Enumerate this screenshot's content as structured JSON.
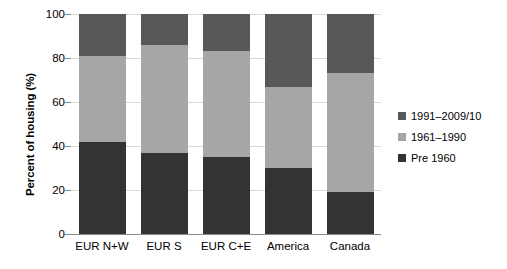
{
  "chart_data": {
    "type": "bar",
    "subtype": "stacked-bar",
    "title": "",
    "xlabel": "",
    "ylabel": "Percent of housing (%)",
    "ylim": [
      0,
      100
    ],
    "yticks": [
      0,
      20,
      40,
      60,
      80,
      100
    ],
    "ytick_labels": [
      "0",
      "20",
      "40",
      "60",
      "80",
      "100"
    ],
    "grid": true,
    "legend_position": "right",
    "categories": [
      "EUR N+W",
      "EUR S",
      "EUR C+E",
      "America",
      "Canada"
    ],
    "series": [
      {
        "name": "Pre 1960",
        "color": "#333333",
        "values": [
          42,
          37,
          35,
          30,
          19
        ]
      },
      {
        "name": "1961–1990",
        "color": "#a6a6a6",
        "values": [
          39,
          49,
          48,
          37,
          54
        ]
      },
      {
        "name": "1991–2009/10",
        "color": "#585858",
        "values": [
          19,
          14,
          17,
          33,
          27
        ]
      }
    ],
    "legend_entries": [
      {
        "label": "1991–2009/10",
        "color": "#585858"
      },
      {
        "label": "1961–1990",
        "color": "#a6a6a6"
      },
      {
        "label": "Pre 1960",
        "color": "#333333"
      }
    ]
  },
  "colors": {
    "gridline": "#d9d9d9",
    "axis": "#898989",
    "text": "#000000",
    "background": "#ffffff"
  }
}
